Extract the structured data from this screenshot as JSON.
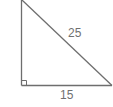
{
  "diagram": {
    "type": "right-triangle",
    "labels": {
      "hypotenuse": "25",
      "base": "15"
    },
    "colors": {
      "stroke": "#6e6e6e",
      "text": "#707070",
      "background": "#ffffff"
    },
    "right_angle_marker": true
  }
}
